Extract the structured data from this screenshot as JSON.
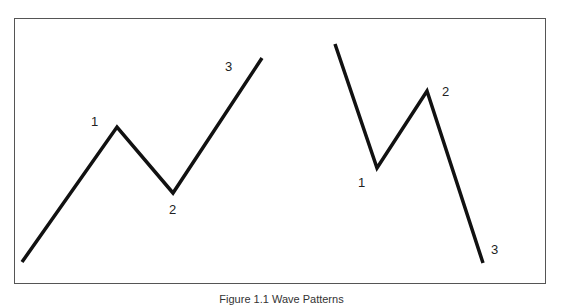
{
  "diagram": {
    "frame_color": "#555555",
    "line_color": "#111111",
    "left_pattern": {
      "name": "uptrend",
      "points": [
        [
          22,
          262
        ],
        [
          117,
          127
        ],
        [
          173,
          193
        ],
        [
          262,
          58
        ]
      ],
      "labels": [
        {
          "text": "1",
          "x": 91,
          "y": 115
        },
        {
          "text": "2",
          "x": 169,
          "y": 203
        },
        {
          "text": "3",
          "x": 225,
          "y": 60
        }
      ]
    },
    "right_pattern": {
      "name": "downtrend",
      "points": [
        [
          335,
          44
        ],
        [
          377,
          168
        ],
        [
          427,
          91
        ],
        [
          483,
          263
        ]
      ],
      "labels": [
        {
          "text": "1",
          "x": 358,
          "y": 176
        },
        {
          "text": "2",
          "x": 442,
          "y": 85
        },
        {
          "text": "3",
          "x": 491,
          "y": 243
        }
      ]
    }
  },
  "caption": "Figure 1.1 Wave Patterns"
}
